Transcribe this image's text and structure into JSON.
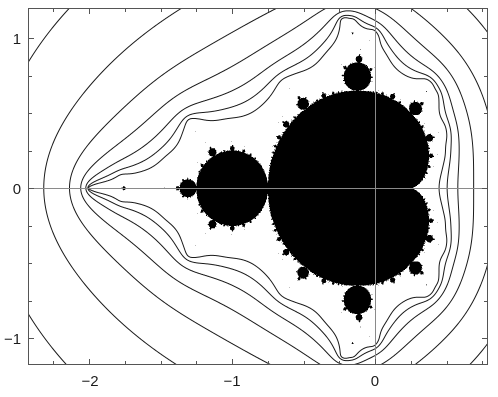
{
  "figure": {
    "title": "",
    "background_color": "#ffffff",
    "width": 498,
    "height": 397
  },
  "chart_data": {
    "type": "heatmap",
    "title": "",
    "subtitle": "",
    "xlabel": "",
    "ylabel": "",
    "set_fill_color": "#000000",
    "contour_color": "#1a1a1a",
    "axis_line_color": "#8a8a8a",
    "frame_color": "#555555",
    "grid": false,
    "legend": "none",
    "xlim": [
      -2.427,
      0.79
    ],
    "ylim": [
      -1.18,
      1.2
    ],
    "axes_pixel_box": {
      "left": 28,
      "top": 8,
      "right": 488,
      "bottom": 365
    },
    "xticks_major": [
      -2,
      -1,
      0
    ],
    "xtick_labels": [
      "−2",
      "−1",
      "0"
    ],
    "yticks_major": [
      1,
      0,
      -1
    ],
    "ytick_labels": [
      "1",
      "0",
      "−1"
    ],
    "tick_step_minor": 0.25,
    "axis_lines": {
      "x": 0,
      "y": 0
    },
    "mandelbrot": {
      "max_iterations": 400,
      "escape_radius": 1000,
      "interior_color": "#000000",
      "exterior_color": "#ffffff"
    },
    "contours": {
      "quantity": "escape_potential",
      "levels": [
        0.022,
        0.038,
        0.062,
        0.1,
        0.155,
        0.24,
        0.36,
        0.54,
        0.8,
        1.18
      ],
      "count": 10,
      "line_width_px": 1
    }
  },
  "xtick_positions_px": [
    90,
    232,
    375
  ],
  "ytick_positions_px": [
    38,
    188,
    338
  ]
}
